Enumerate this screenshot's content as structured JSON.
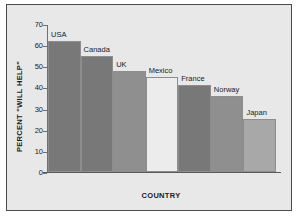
{
  "chart_data": {
    "type": "bar",
    "title": "",
    "xlabel": "COUNTRY",
    "ylabel": "PERCENT \"WILL HELP\"",
    "categories": [
      "USA",
      "Canada",
      "UK",
      "Mexico",
      "France",
      "Norway",
      "Japan"
    ],
    "values": [
      62,
      55,
      48,
      45,
      41,
      36,
      25
    ],
    "ylim": [
      0,
      70
    ],
    "ytick_labels": [
      "0",
      "10",
      "20",
      "30",
      "40",
      "50",
      "60",
      "70"
    ],
    "ytick_values": [
      0,
      10,
      20,
      30,
      40,
      50,
      60,
      70
    ],
    "grid": false,
    "legend": "none",
    "bar_colors": [
      "#787878",
      "#787878",
      "#8f8f8f",
      "#ececec",
      "#787878",
      "#8f8f8f",
      "#a8a8a8"
    ],
    "labels_above_bars": true,
    "plot_background": "#e8e8e8",
    "frame_color": "#4a4a4a"
  }
}
